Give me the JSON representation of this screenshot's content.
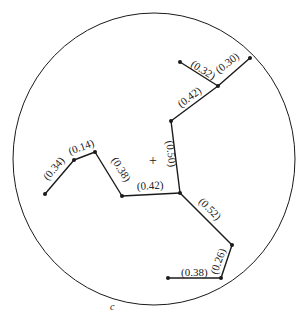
{
  "diagram": {
    "caption": "c",
    "center_marker": "+",
    "boundary": {
      "shape": "circle",
      "cx": 154,
      "cy": 159,
      "rx": 141,
      "ry": 146
    },
    "colors": {
      "stroke": "#1a1a1a",
      "background": "#ffffff"
    },
    "nodes": [
      {
        "id": "A",
        "x": 180,
        "y": 62
      },
      {
        "id": "B",
        "x": 250,
        "y": 58
      },
      {
        "id": "C",
        "x": 218,
        "y": 86
      },
      {
        "id": "D",
        "x": 171,
        "y": 121
      },
      {
        "id": "E",
        "x": 180,
        "y": 193
      },
      {
        "id": "F",
        "x": 122,
        "y": 196
      },
      {
        "id": "G",
        "x": 95,
        "y": 152
      },
      {
        "id": "H",
        "x": 74,
        "y": 160
      },
      {
        "id": "I",
        "x": 45,
        "y": 194
      },
      {
        "id": "J",
        "x": 232,
        "y": 245
      },
      {
        "id": "K",
        "x": 221,
        "y": 278
      },
      {
        "id": "L",
        "x": 168,
        "y": 278
      }
    ],
    "edges": [
      {
        "from": "A",
        "to": "C",
        "label": "(0.32)"
      },
      {
        "from": "C",
        "to": "B",
        "label": "(0.30)"
      },
      {
        "from": "D",
        "to": "C",
        "label": "(0.42)"
      },
      {
        "from": "E",
        "to": "D",
        "label": "(0.50)"
      },
      {
        "from": "F",
        "to": "E",
        "label": "(0.42)"
      },
      {
        "from": "G",
        "to": "F",
        "label": "(0.38)"
      },
      {
        "from": "H",
        "to": "G",
        "label": "(0.14)"
      },
      {
        "from": "I",
        "to": "H",
        "label": "(0.34)"
      },
      {
        "from": "E",
        "to": "J",
        "label": "(0.52)"
      },
      {
        "from": "J",
        "to": "K",
        "label": "(0.26)"
      },
      {
        "from": "L",
        "to": "K",
        "label": "(0.38)"
      }
    ]
  }
}
